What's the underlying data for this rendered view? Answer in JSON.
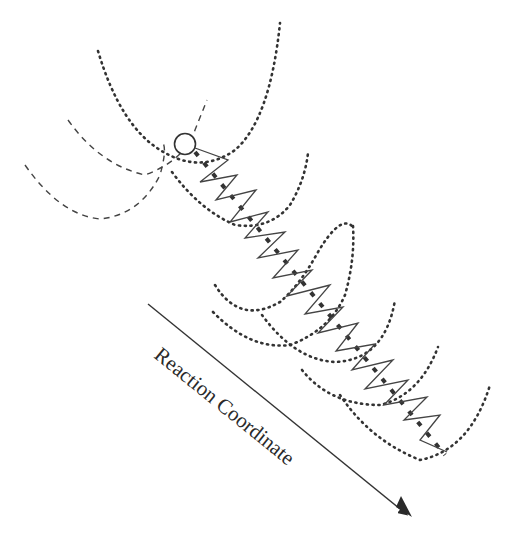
{
  "diagram": {
    "axis_label": "Reaction Coordinate",
    "colors": {
      "ink": "#3a3a3a",
      "background": "#ffffff"
    },
    "elements": {
      "reactant_wells": "dashed-parabolas",
      "product_wells": "dotted-parabolas",
      "start_marker": "open-circle",
      "path": "zigzag-oscillation",
      "direction": "arrow-down-right"
    }
  }
}
